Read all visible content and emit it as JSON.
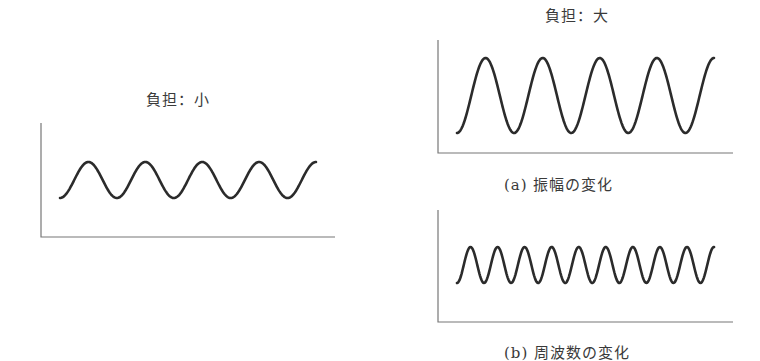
{
  "panels": {
    "small_load": {
      "title": "負担：小",
      "wave": {
        "x_start": 60,
        "x_end": 316,
        "y_peak": 162,
        "y_trough": 198,
        "cycles": 4.5
      },
      "axes": {
        "x": 41,
        "y_top": 123,
        "y_bottom": 237,
        "x_end": 335
      }
    },
    "large_load": {
      "title": "負担：大",
      "caption": "(a) 振幅の変化",
      "wave": {
        "x_start": 457,
        "x_end": 714,
        "y_peak": 58,
        "y_trough": 133,
        "cycles": 4.5
      },
      "axes": {
        "x": 438,
        "y_top": 40,
        "y_bottom": 153,
        "x_end": 733
      }
    },
    "frequency": {
      "caption": "(b) 周波数の変化",
      "wave": {
        "x_start": 457,
        "x_end": 714,
        "y_peak": 247,
        "y_trough": 283,
        "cycles": 9.5
      },
      "axes": {
        "x": 438,
        "y_top": 210,
        "y_bottom": 322,
        "x_end": 733
      }
    }
  },
  "colors": {
    "wave": "#2b2b2b",
    "axis": "#777777",
    "text": "#3a3a3a"
  }
}
